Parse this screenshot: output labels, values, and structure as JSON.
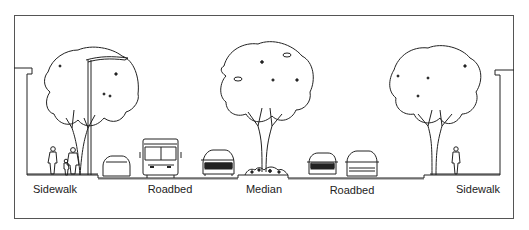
{
  "diagram": {
    "type": "street-cross-section",
    "labels": [
      {
        "text": "Sidewalk",
        "x": 55
      },
      {
        "text": "Roadbed",
        "x": 170
      },
      {
        "text": "Median",
        "x": 264
      },
      {
        "text": "Roadbed",
        "x": 352
      },
      {
        "text": "Sidewalk",
        "x": 478
      }
    ],
    "elements": [
      "building-left",
      "pedestrians",
      "street-lamp",
      "tree-left",
      "car",
      "bus",
      "car",
      "tree-median",
      "shrubs",
      "car",
      "pickup-truck",
      "tree-right",
      "pedestrian",
      "building-right"
    ],
    "colors": {
      "line": "#222222",
      "frame": "#555555",
      "background": "#ffffff"
    }
  }
}
